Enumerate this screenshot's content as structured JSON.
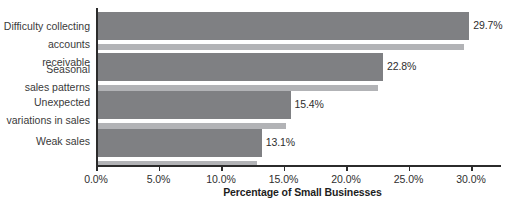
{
  "chart_data": {
    "type": "bar",
    "orientation": "horizontal",
    "title": "",
    "xlabel": "Percentage of Small Businesses",
    "ylabel": "",
    "categories": [
      "Difficulty collecting\naccounts receivable",
      "Seasonal\nsales patterns",
      "Unexpected\nvariations in sales",
      "Weak sales"
    ],
    "values": [
      29.7,
      22.8,
      15.4,
      13.1
    ],
    "value_labels": [
      "29.7%",
      "22.8%",
      "15.4%",
      "13.1%"
    ],
    "xlim": [
      0.0,
      32.4
    ],
    "xticks": [
      0.0,
      5.0,
      10.0,
      15.0,
      20.0,
      25.0,
      30.0
    ],
    "xtick_labels": [
      "0.0%",
      "5.0%",
      "10.0%",
      "15.0%",
      "20.0%",
      "25.0%",
      "30.0%"
    ],
    "grid": false,
    "legend": null,
    "colors": {
      "bar": "#7f8083",
      "bar_shadow": "#b2b3b6",
      "axis": "#2b2b2b",
      "text": "#2e2e2e",
      "background": "#ffffff"
    }
  }
}
